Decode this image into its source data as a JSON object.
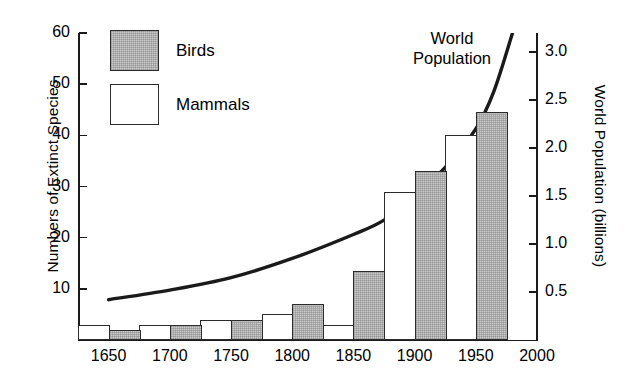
{
  "chart_data": {
    "type": "bar",
    "title": "",
    "subtitle": "",
    "xlabel": "",
    "ylabel": "Numbers of Extinct Species",
    "ylabel_right": "World Population (billions)",
    "grid": false,
    "legend_position": "top-left",
    "x_axis": {
      "ticks": [
        1650,
        1700,
        1750,
        1800,
        1850,
        1900,
        1950,
        2000
      ],
      "tick_labels": [
        "1650",
        "1700",
        "1750",
        "1800",
        "1850",
        "1900",
        "1950",
        "2000"
      ],
      "xlim": [
        1625,
        2000
      ]
    },
    "y_axis_left": {
      "ticks": [
        10,
        20,
        30,
        40,
        50,
        60
      ],
      "tick_labels": [
        "10",
        "20",
        "30",
        "40",
        "50",
        "60"
      ],
      "ylim": [
        0,
        60
      ]
    },
    "y_axis_right": {
      "ticks": [
        0.5,
        1.0,
        1.5,
        2.0,
        2.5,
        3.0
      ],
      "tick_labels": [
        "0.5",
        "1.0",
        "1.5",
        "2.0",
        "2.5",
        "3.0"
      ],
      "ylim": [
        0,
        3.2
      ]
    },
    "bars": [
      {
        "period_start": 1625,
        "period_end": 1650,
        "series": "Mammals",
        "value": 3
      },
      {
        "period_start": 1650,
        "period_end": 1675,
        "series": "Birds",
        "value": 2
      },
      {
        "period_start": 1675,
        "period_end": 1700,
        "series": "Mammals",
        "value": 3
      },
      {
        "period_start": 1700,
        "period_end": 1725,
        "series": "Birds",
        "value": 3
      },
      {
        "period_start": 1725,
        "period_end": 1750,
        "series": "Mammals",
        "value": 4
      },
      {
        "period_start": 1750,
        "period_end": 1775,
        "series": "Birds",
        "value": 4
      },
      {
        "period_start": 1775,
        "period_end": 1800,
        "series": "Mammals",
        "value": 5
      },
      {
        "period_start": 1800,
        "period_end": 1825,
        "series": "Birds",
        "value": 7
      },
      {
        "period_start": 1825,
        "period_end": 1850,
        "series": "Mammals",
        "value": 3
      },
      {
        "period_start": 1850,
        "period_end": 1875,
        "series": "Birds",
        "value": 13.5
      },
      {
        "period_start": 1875,
        "period_end": 1900,
        "series": "Mammals",
        "value": 29
      },
      {
        "period_start": 1900,
        "period_end": 1925,
        "series": "Birds",
        "value": 33
      },
      {
        "period_start": 1925,
        "period_end": 1950,
        "series": "Mammals",
        "value": 40
      },
      {
        "period_start": 1950,
        "period_end": 1975,
        "series": "Birds",
        "value": 44.5
      }
    ],
    "series": [
      {
        "name": "Birds",
        "color": "#c9c9c9",
        "values": [
          2,
          3,
          4,
          7,
          13.5,
          33,
          44.5
        ]
      },
      {
        "name": "Mammals",
        "color": "#ffffff",
        "values": [
          3,
          3,
          4,
          5,
          3,
          29,
          40
        ]
      }
    ],
    "line_series": {
      "name": "World Population",
      "unit": "billions",
      "axis": "right",
      "x": [
        1650,
        1700,
        1750,
        1800,
        1850,
        1875,
        1900,
        1925,
        1950,
        1965,
        1980
      ],
      "y": [
        0.42,
        0.52,
        0.65,
        0.85,
        1.1,
        1.25,
        1.5,
        1.8,
        2.2,
        2.6,
        3.2
      ]
    },
    "annotations": [
      {
        "text": "World\nPopulation",
        "x": 1880,
        "y": 2.9
      }
    ]
  },
  "legend": {
    "items": [
      {
        "label": "Birds",
        "swatch": "birds"
      },
      {
        "label": "Mammals",
        "swatch": "mammals"
      }
    ]
  },
  "annotation": {
    "line1": "World",
    "line2": "Population"
  },
  "axes": {
    "left_title": "Numbers of Extinct Species",
    "right_title": "World Population (billions)"
  }
}
